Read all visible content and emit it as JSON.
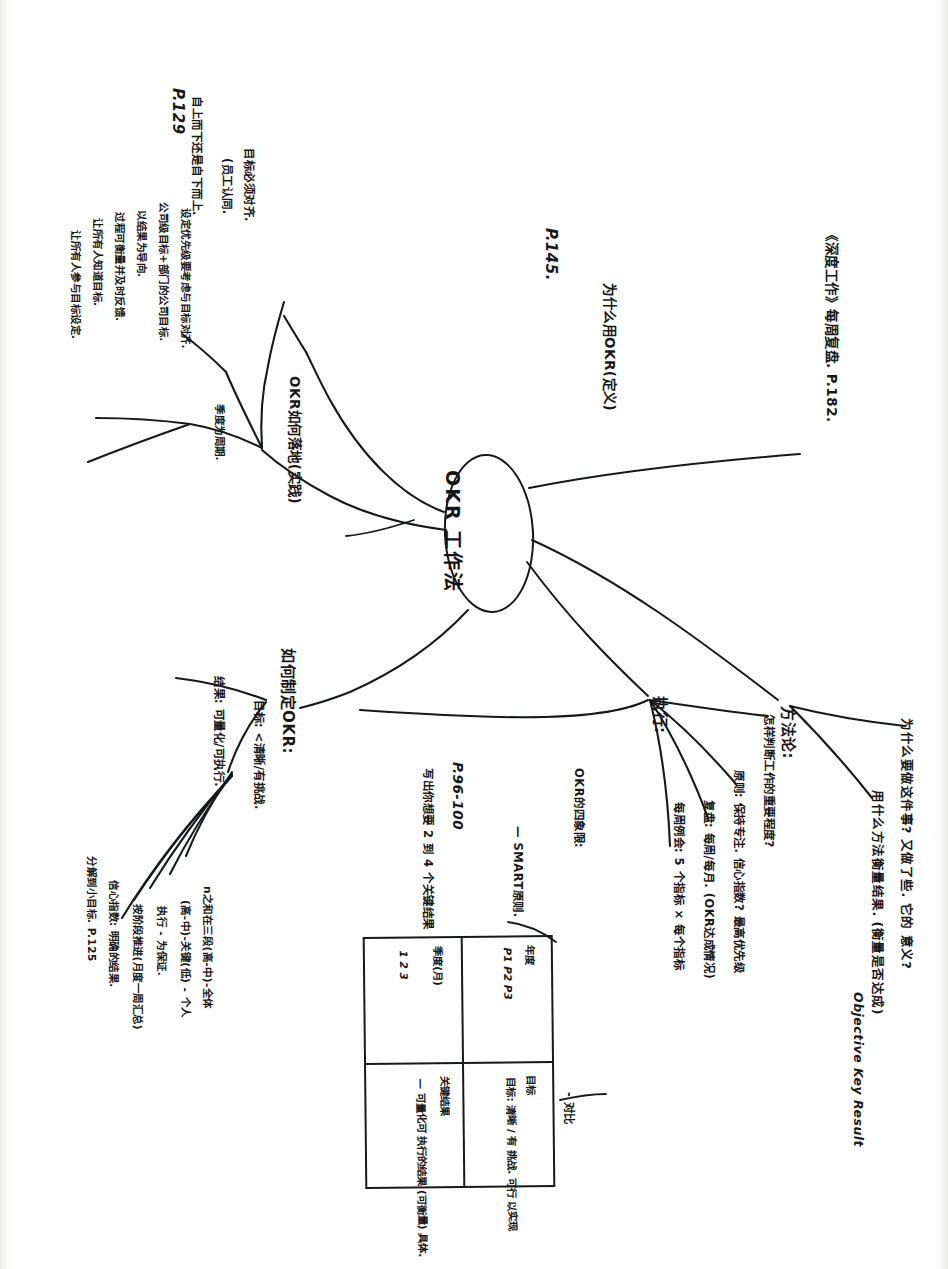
{
  "document": {
    "kind": "handwritten-mindmap-scan",
    "orientation": "text rotated 90 degrees clockwise",
    "ink_color": "#17181a",
    "paper_color": "#fdfdfc"
  },
  "center": {
    "label": "OKR 工作法"
  },
  "branches": {
    "top_right": {
      "label": "《深度工作》每周复盘. P.182."
    },
    "upper_left_page": {
      "label": "P.145."
    },
    "why_okr": {
      "label": "为什么用OKR(定义)"
    },
    "method": {
      "label": "方法论:",
      "children": [
        "为什么要做这件事? 又做了些. 它的 意义?",
        "用什么方法衡量结果. (衡量是否达成)",
        "Objective Key Result"
      ]
    },
    "execute": {
      "label": "执行:",
      "children": [
        "怎样判断工作的重要程度?",
        "原则: 保持专注. 信心指数? 最高优先级",
        "复盘: 每周/每月. (OKR达成情况)",
        "每周例会: 5 个指标 × 每个指标",
        "OKR的四象限:",
        "— SMART原则."
      ]
    },
    "how_to_write": {
      "label": "如何制定OKR:",
      "page": "P.96-100",
      "children": [
        "写出你想要 2 到 4 个关键结果",
        "目标: <清晰/有挑战.",
        "结果: 可量化/可执行.",
        "n之和在三段(高-中)-全体",
        "(高-中)-关键(低) - 个人",
        "执行 - 为保证.",
        "按阶段推进(月度一周汇总)",
        "信心指数: 明确的结果.",
        "分解到小目标. P.125"
      ]
    },
    "practice": {
      "label": "OKR如何落地(实践)",
      "page": "P.129",
      "children": [
        "自上而下还是自下而上.",
        "(员工认同.",
        "目标必须对齐.",
        "设定优先级要考虑与目标对齐.",
        "公司级目标+部门的公司目标.",
        "以结果为导向.",
        "过程可衡量并及时反馈.",
        "让所有人知道目标.",
        "让所有人参与目标设定.",
        "季度为周期."
      ]
    }
  },
  "matrix": {
    "col_headers": [
      "年度",
      "季度(月)"
    ],
    "row_headers": [
      "目标",
      "关键结果"
    ],
    "cells": {
      "year_items": "P1\nP2\nP3",
      "quarter_items": "1\n2\n3",
      "goal": "目标: 清晰 / 有\n挑战. 可行\n以实现",
      "key_result": "— 可量化可\n执行的结果\n(可衡量)\n具体."
    },
    "caption": "- 对比"
  },
  "annotations": {
    "smart": "- SMART原则",
    "four_quadrant": "OKR的四象限:",
    "page_range": "P.96-100"
  }
}
